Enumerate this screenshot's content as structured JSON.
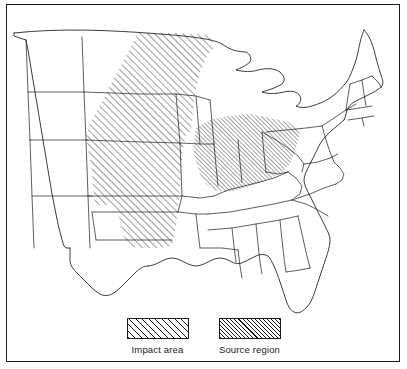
{
  "figure": {
    "background_color": "#ffffff",
    "line_color": "#1a1a1a",
    "frame": {
      "visible": true
    }
  },
  "legend": {
    "entries": [
      {
        "key": "impact-area",
        "label": "Impact area",
        "pattern": "diagonal-hatch-coarse",
        "hatch_angle_deg": 45,
        "hatch_spacing_px": 4.6,
        "color": "#1a1a1a"
      },
      {
        "key": "source-region",
        "label": "Source region",
        "pattern": "diagonal-hatch-fine",
        "hatch_angle_deg": 45,
        "hatch_spacing_px": 2.9,
        "color": "#1a1a1a"
      }
    ]
  },
  "map_data": {
    "type": "choropleth-hatch",
    "projection": "conic",
    "extent": "contiguous United States, cropped at western edge near the Rocky Mountains",
    "regions": [
      {
        "key": "impact-area",
        "label": "Impact area",
        "pattern": "diagonal-hatch-coarse",
        "states": [
          "North Dakota",
          "South Dakota",
          "Minnesota",
          "Nebraska",
          "Iowa",
          "Kansas",
          "Oklahoma",
          "Texas Panhandle"
        ]
      },
      {
        "key": "source-region",
        "label": "Source region",
        "pattern": "diagonal-hatch-fine",
        "states": [
          "Missouri",
          "Illinois",
          "Indiana",
          "Ohio",
          "Kentucky",
          "West Virginia"
        ]
      }
    ],
    "unshaded_states": [
      "Montana",
      "Wyoming",
      "Colorado",
      "New Mexico",
      "Texas",
      "Louisiana",
      "Arkansas",
      "Mississippi",
      "Alabama",
      "Tennessee",
      "Georgia",
      "Florida",
      "South Carolina",
      "North Carolina",
      "Virginia",
      "Maryland",
      "Delaware",
      "Pennsylvania",
      "New Jersey",
      "New York",
      "Connecticut",
      "Rhode Island",
      "Massachusetts",
      "Vermont",
      "New Hampshire",
      "Maine",
      "Michigan",
      "Wisconsin"
    ],
    "features": [
      "Great Lakes outlines",
      "Gulf of Mexico coastline",
      "Atlantic coastline",
      "Florida peninsula",
      "Canadian border"
    ]
  }
}
